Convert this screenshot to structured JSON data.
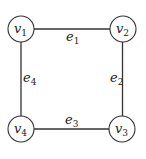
{
  "graph": {
    "nodes": [
      {
        "id": "v1",
        "label": "v",
        "sub": "1",
        "x": 21,
        "y": 29
      },
      {
        "id": "v2",
        "label": "v",
        "sub": "2",
        "x": 123,
        "y": 29
      },
      {
        "id": "v3",
        "label": "v",
        "sub": "3",
        "x": 122,
        "y": 129
      },
      {
        "id": "v4",
        "label": "v",
        "sub": "4",
        "x": 21,
        "y": 129
      }
    ],
    "edges": [
      {
        "id": "e1",
        "label": "e",
        "sub": "1",
        "from": "v1",
        "to": "v2"
      },
      {
        "id": "e2",
        "label": "e",
        "sub": "2",
        "from": "v2",
        "to": "v3"
      },
      {
        "id": "e3",
        "label": "e",
        "sub": "3",
        "from": "v4",
        "to": "v3"
      },
      {
        "id": "e4",
        "label": "e",
        "sub": "4",
        "from": "v1",
        "to": "v4"
      }
    ]
  },
  "colors": {
    "stroke": "#333333",
    "node_fill": "#ffffff"
  }
}
